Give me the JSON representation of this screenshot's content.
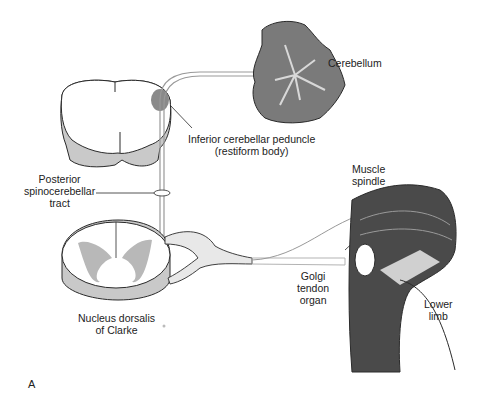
{
  "figure": {
    "panel_label": "A",
    "labels": {
      "cerebellum": [
        "Cerebellum"
      ],
      "peduncle": [
        "Inferior cerebellar peduncle",
        "(restiform body)"
      ],
      "tract": [
        "Posterior",
        "spinocerebellar",
        "tract"
      ],
      "nucleus": [
        "Nucleus dorsalis",
        "of Clarke"
      ],
      "spindle": [
        "Muscle",
        "spindle"
      ],
      "golgi": [
        "Golgi",
        "tendon",
        "organ"
      ],
      "limb": [
        "Lower",
        "limb"
      ]
    },
    "colors": {
      "outline": "#2a2a2a",
      "gray_matter": "#b8b8b8",
      "tract_shade": "#8a8a8a",
      "cerebellum_fill": "#7a7a7a",
      "muscle_dark": "#3a3a3a",
      "nerve_fill": "#e8e8e8"
    }
  }
}
